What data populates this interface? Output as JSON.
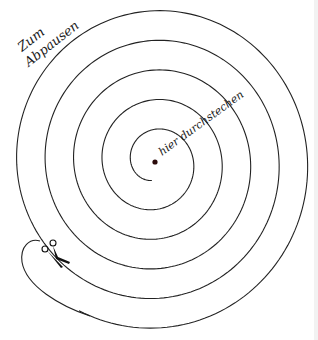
{
  "diagram": {
    "labels": {
      "trace": {
        "line1": "Zum",
        "line2": "Abpausen"
      },
      "pierce": "hier durchstechen"
    },
    "center": {
      "x": 155,
      "y": 162
    },
    "spiral": {
      "start_radius": 18,
      "ring_spacing": 28.5,
      "turns": 5.05,
      "start_angle_deg": 100,
      "stroke": "#222222",
      "stroke_width": 1.1
    },
    "scissors": {
      "x": 55,
      "y": 258,
      "color": "#111111"
    },
    "center_dot": {
      "radius": 2.6,
      "color": "#2a0a0a"
    },
    "background": "#ffffff"
  }
}
